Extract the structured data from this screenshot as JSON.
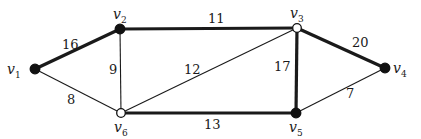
{
  "diagram": {
    "type": "weighted-graph",
    "colors": {
      "edge": "#1a1a1a",
      "filled_node": "#111111",
      "hollow_node": "#ffffff"
    },
    "vertices": [
      {
        "id": "v1",
        "name": "v",
        "sub": "1",
        "x": 35,
        "y": 69,
        "filled": true,
        "lx": 7,
        "ly": 74,
        "anchor": "start"
      },
      {
        "id": "v2",
        "name": "v",
        "sub": "2",
        "x": 120,
        "y": 29,
        "filled": true,
        "lx": 113,
        "ly": 19,
        "anchor": "start"
      },
      {
        "id": "v3",
        "name": "v",
        "sub": "3",
        "x": 297,
        "y": 28,
        "filled": false,
        "lx": 290,
        "ly": 18,
        "anchor": "start"
      },
      {
        "id": "v4",
        "name": "v",
        "sub": "4",
        "x": 385,
        "y": 68,
        "filled": true,
        "lx": 393,
        "ly": 73,
        "anchor": "start"
      },
      {
        "id": "v5",
        "name": "v",
        "sub": "5",
        "x": 296,
        "y": 113,
        "filled": true,
        "lx": 289,
        "ly": 132,
        "anchor": "start"
      },
      {
        "id": "v6",
        "name": "v",
        "sub": "6",
        "x": 121,
        "y": 113,
        "filled": false,
        "lx": 114,
        "ly": 132,
        "anchor": "start"
      }
    ],
    "edges": [
      {
        "from": "v1",
        "to": "v2",
        "weight": "16",
        "bold": true,
        "lx": 62,
        "ly": 49
      },
      {
        "from": "v2",
        "to": "v3",
        "weight": "11",
        "bold": true,
        "lx": 208,
        "ly": 23
      },
      {
        "from": "v3",
        "to": "v4",
        "weight": "20",
        "bold": true,
        "lx": 352,
        "ly": 47
      },
      {
        "from": "v3",
        "to": "v5",
        "weight": "17",
        "bold": true,
        "lx": 274,
        "ly": 71
      },
      {
        "from": "v6",
        "to": "v5",
        "weight": "13",
        "bold": true,
        "lx": 204,
        "ly": 129
      },
      {
        "from": "v1",
        "to": "v6",
        "weight": "8",
        "bold": false,
        "lx": 67,
        "ly": 104
      },
      {
        "from": "v2",
        "to": "v6",
        "weight": "9",
        "bold": false,
        "lx": 109,
        "ly": 74
      },
      {
        "from": "v6",
        "to": "v3",
        "weight": "12",
        "bold": false,
        "lx": 184,
        "ly": 74
      },
      {
        "from": "v5",
        "to": "v4",
        "weight": "7",
        "bold": false,
        "lx": 346,
        "ly": 98
      }
    ]
  }
}
